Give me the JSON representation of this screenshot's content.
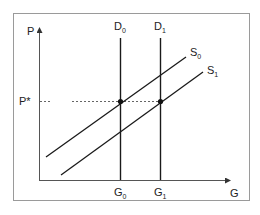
{
  "diagram": {
    "type": "supply-demand",
    "axes": {
      "y_label": "P",
      "x_label": "G"
    },
    "price_level": {
      "label": "P*"
    },
    "demand_curves": [
      {
        "name": "D0",
        "base": "D",
        "sub": "0",
        "x_label": {
          "base": "G",
          "sub": "0"
        }
      },
      {
        "name": "D1",
        "base": "D",
        "sub": "1",
        "x_label": {
          "base": "G",
          "sub": "1"
        }
      }
    ],
    "supply_curves": [
      {
        "name": "S0",
        "base": "S",
        "sub": "0"
      },
      {
        "name": "S1",
        "base": "S",
        "sub": "1"
      }
    ],
    "equilibria": [
      {
        "at": "D0-S0",
        "price": "P*",
        "quantity": "G0"
      },
      {
        "at": "D1-S1",
        "price": "P*",
        "quantity": "G1"
      }
    ],
    "colors": {
      "line": "#1a1a1a",
      "frame": "#9a9a9a",
      "dashed": "#666666"
    }
  }
}
